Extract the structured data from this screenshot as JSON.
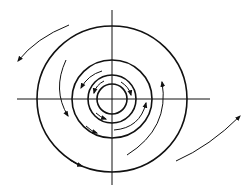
{
  "diagram": {
    "type": "spiral-vortex",
    "stroke_color": "#111111",
    "background": "#ffffff",
    "center": [
      112,
      99
    ],
    "axes": {
      "horizontal": {
        "x1": 17,
        "x2": 210,
        "y": 99
      },
      "vertical": {
        "y1": 10,
        "y2": 185,
        "x": 112
      }
    },
    "circles": [
      {
        "name": "innermost",
        "rx": 15,
        "ry": 15
      },
      {
        "name": "second",
        "rx": 24,
        "ry": 24
      },
      {
        "name": "third",
        "rx": 40,
        "ry": 39
      },
      {
        "name": "outer",
        "rx": 75,
        "ry": 73
      }
    ],
    "flow_direction": "counterclockwise-in-upper-left, outward spiral"
  }
}
